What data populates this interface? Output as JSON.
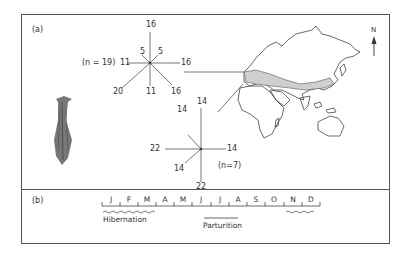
{
  "panel_a": {
    "label": "(a)",
    "north_label": "N",
    "rose_1": {
      "n_label": "(n = 19)",
      "values": {
        "N": "16",
        "NE": "5",
        "E": "16",
        "SE": "16",
        "S": "11",
        "SW": "20",
        "W": "11",
        "NW": "5"
      }
    },
    "rose_2": {
      "n_label": "(n=7)",
      "values": {
        "N": "14",
        "NW": "14",
        "E": "14",
        "S": "22",
        "SW": "14",
        "W": "22"
      }
    },
    "map_description": "Outline map of Eurasia, Africa and Australia with shaded species range across southern Europe to East Asia"
  },
  "panel_b": {
    "label": "(b)",
    "months": [
      "J",
      "F",
      "M",
      "A",
      "M",
      "J",
      "J",
      "A",
      "S",
      "O",
      "N",
      "D"
    ],
    "hibernation_label": "Hibernation",
    "parturition_label": "Parturition"
  }
}
